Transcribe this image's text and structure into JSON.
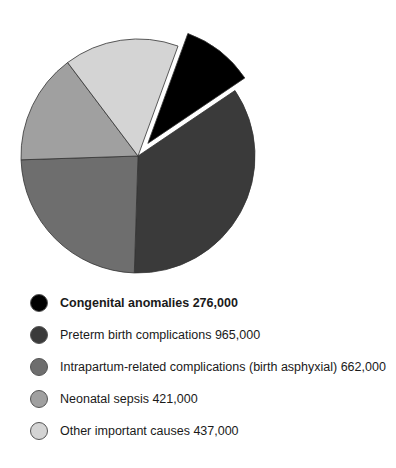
{
  "chart_data": {
    "type": "pie",
    "title": "",
    "exploded": [
      "Congenital anomalies"
    ],
    "categories": [
      "Congenital anomalies",
      "Preterm birth complications",
      "Intrapartum-related complications (birth asphyxial)",
      "Neonatal sepsis",
      "Other important causes"
    ],
    "values": [
      276000,
      965000,
      662000,
      421000,
      437000
    ],
    "colors": [
      "#000000",
      "#3a3a3a",
      "#6e6e6e",
      "#a0a0a0",
      "#d4d4d4"
    ],
    "legend_position": "bottom"
  },
  "legend": [
    {
      "label": "Congenital anomalies 276,000",
      "color": "#000000",
      "bold": true
    },
    {
      "label": "Preterm birth complications 965,000",
      "color": "#3a3a3a",
      "bold": false
    },
    {
      "label": "Intrapartum-related complications (birth asphyxial) 662,000",
      "color": "#6e6e6e",
      "bold": false
    },
    {
      "label": "Neonatal sepsis 421,000",
      "color": "#a0a0a0",
      "bold": false
    },
    {
      "label": "Other important causes 437,000",
      "color": "#d4d4d4",
      "bold": false
    }
  ]
}
